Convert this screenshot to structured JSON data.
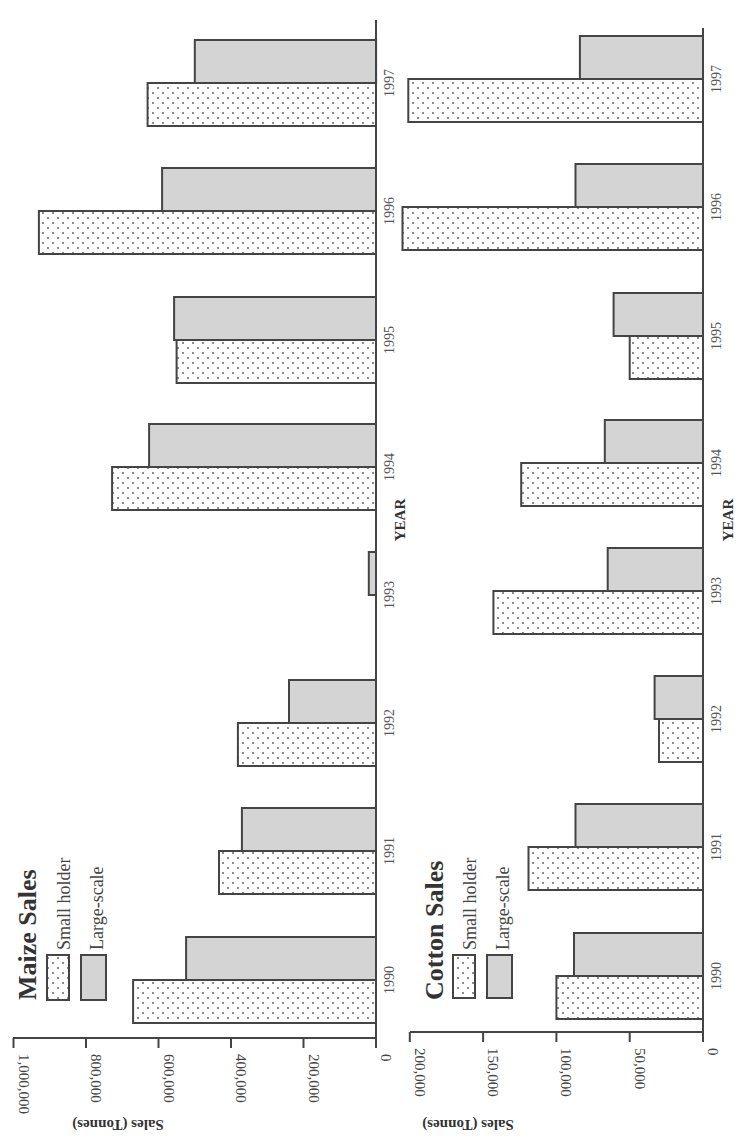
{
  "colors": {
    "axis": "#444444",
    "large_scale_fill": "#d4d4d4",
    "small_holder_fill": "#ffffff",
    "dot": "#555555"
  },
  "layout": {
    "rotation": "90deg clockwise (value axis along bottom, years along right side, top-to-bottom 1997 to 1990)"
  },
  "chart_data": [
    {
      "type": "bar",
      "title": "Maize Sales",
      "xlabel": "YEAR",
      "ylabel": "Sales (Tonnes)",
      "categories": [
        "1990",
        "1991",
        "1992",
        "1993",
        "1994",
        "1995",
        "1996",
        "1997"
      ],
      "series": [
        {
          "name": "Small holder",
          "pattern": "dotted",
          "values": [
            670000,
            433000,
            381000,
            null,
            728000,
            550000,
            930000,
            630000
          ]
        },
        {
          "name": "Large-scale",
          "pattern": "gray",
          "values": [
            524000,
            370000,
            240000,
            20000,
            626000,
            557000,
            590000,
            500000
          ]
        }
      ],
      "ylim": [
        0,
        1000000
      ],
      "yticks": [
        0,
        200000,
        400000,
        600000,
        800000,
        1000000
      ],
      "ytick_labels": [
        "0",
        "200,000",
        "400,000",
        "600,000",
        "800,000",
        "1,000,000"
      ],
      "legend": [
        "Small holder",
        "Large-scale"
      ],
      "legend_position": "upper-left (rotated)",
      "grid": false
    },
    {
      "type": "bar",
      "title": "Cotton Sales",
      "xlabel": "YEAR",
      "ylabel": "Sales (Tonnes)",
      "categories": [
        "1990",
        "1991",
        "1992",
        "1993",
        "1994",
        "1995",
        "1996",
        "1997"
      ],
      "series": [
        {
          "name": "Small holder",
          "pattern": "dotted",
          "values": [
            100000,
            119000,
            30000,
            143000,
            124000,
            50000,
            205000,
            201000
          ]
        },
        {
          "name": "Large-scale",
          "pattern": "gray",
          "values": [
            88000,
            87000,
            33000,
            65000,
            67000,
            61000,
            87000,
            84000
          ]
        }
      ],
      "ylim": [
        0,
        200000
      ],
      "yticks": [
        0,
        50000,
        100000,
        150000,
        200000
      ],
      "ytick_labels": [
        "0",
        "50,000",
        "100,000",
        "150,000",
        "200,000"
      ],
      "legend": [
        "Small holder",
        "Large-scale"
      ],
      "legend_position": "upper-left (rotated)",
      "grid": false
    }
  ],
  "maize": {
    "title": "Maize Sales",
    "legend_small": "Small holder",
    "legend_large": "Large-scale",
    "ylabel": "Sales (Tonnes)",
    "xlabel": "YEAR"
  },
  "cotton": {
    "title": "Cotton Sales",
    "legend_small": "Small holder",
    "legend_large": "Large-scale",
    "ylabel": "Sales (Tonnes)",
    "xlabel": "YEAR"
  }
}
